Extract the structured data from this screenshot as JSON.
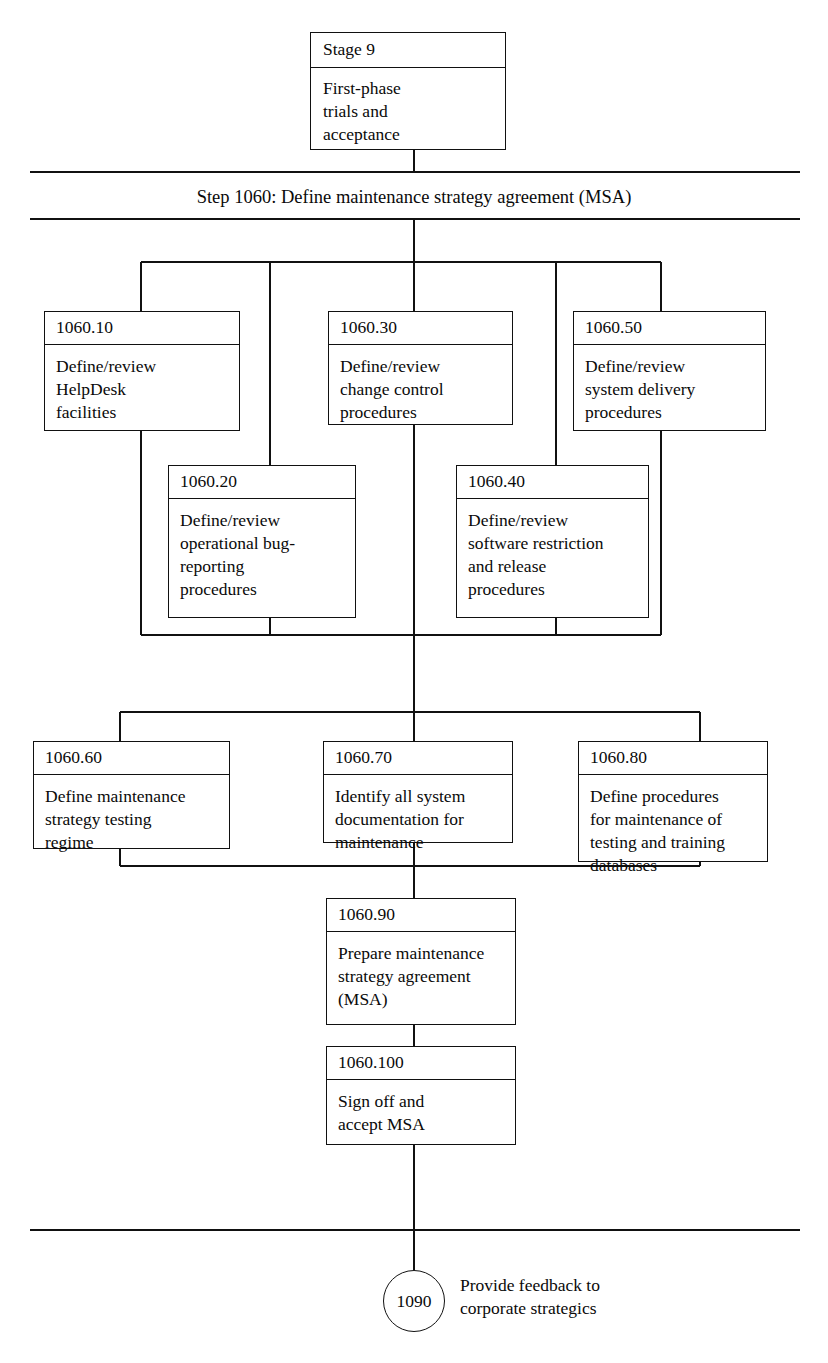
{
  "diagram": {
    "title": "Step 1060: Define maintenance strategy agreement (MSA)",
    "stage": {
      "id": "Stage 9",
      "text": "First-phase\ntrials and\nacceptance"
    },
    "nodes": [
      {
        "id": "1060.10",
        "text": "Define/review\nHelpDesk\nfacilities"
      },
      {
        "id": "1060.30",
        "text": "Define/review\nchange control\nprocedures"
      },
      {
        "id": "1060.50",
        "text": "Define/review\nsystem delivery\nprocedures"
      },
      {
        "id": "1060.20",
        "text": "Define/review\noperational bug-\nreporting\nprocedures"
      },
      {
        "id": "1060.40",
        "text": "Define/review\nsoftware restriction\nand release\nprocedures"
      },
      {
        "id": "1060.60",
        "text": "Define maintenance\nstrategy testing\nregime"
      },
      {
        "id": "1060.70",
        "text": "Identify all system\ndocumentation for\nmaintenance"
      },
      {
        "id": "1060.80",
        "text": "Define procedures\nfor maintenance of\ntesting and training\ndatabases"
      },
      {
        "id": "1060.90",
        "text": "Prepare maintenance\nstrategy agreement\n(MSA)"
      },
      {
        "id": "1060.100",
        "text": "Sign off and\naccept MSA"
      }
    ],
    "terminator": {
      "id": "1090",
      "label": "Provide feedback to\ncorporate strategics"
    },
    "colors": {
      "stroke": "#111111",
      "background": "#ffffff",
      "text": "#0a0a0a"
    }
  }
}
